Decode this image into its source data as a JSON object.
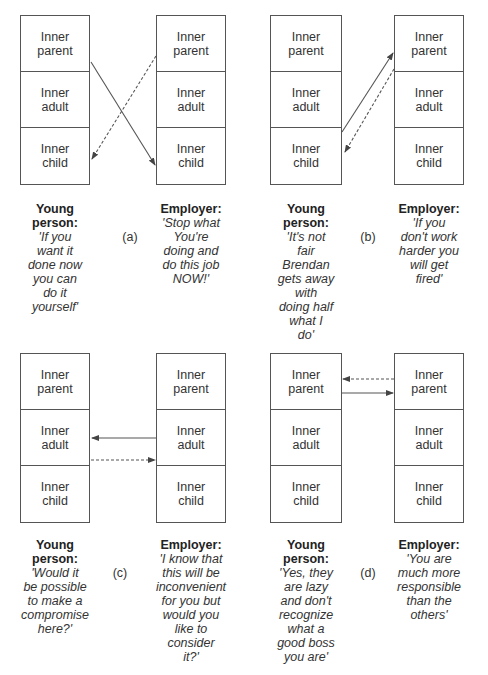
{
  "ego_states": [
    "Inner\nparent",
    "Inner\nadult",
    "Inner\nchild"
  ],
  "roles": {
    "young": "Young\nperson:",
    "employer": "Employer:"
  },
  "panels": {
    "a": {
      "label": "(a)",
      "young_quote": "'If you\nwant it\ndone now\nyou can\ndo it\nyourself'",
      "employer_quote": "'Stop what\nYou're\ndoing and\ndo this job\nNOW!'"
    },
    "b": {
      "label": "(b)",
      "young_quote": "'It's not\nfair\nBrendan\ngets away\nwith\ndoing half\nwhat I\ndo'",
      "employer_quote": "'If you\ndon't work\nharder you\nwill get\nfired'"
    },
    "c": {
      "label": "(c)",
      "young_quote": "'Would it\nbe possible\nto make a\ncompromise\nhere?'",
      "employer_quote": "'I know that\nthis will be\ninconvenient\nfor you but\nwould you\nlike to\nconsider\nit?'"
    },
    "d": {
      "label": "(d)",
      "young_quote": "'Yes, they\nare lazy\nand don't\nrecognize\nwhat a\ngood boss\nyou are'",
      "employer_quote": "'You are\nmuch more\nresponsible\nthan the\nothers'"
    }
  },
  "colors": {
    "line": "#555555",
    "text": "#333333"
  }
}
